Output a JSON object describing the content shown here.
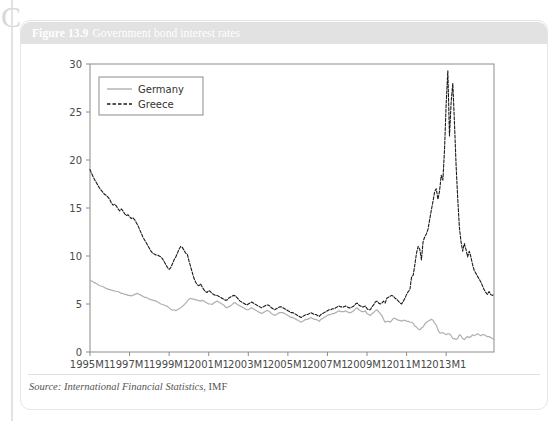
{
  "figure": {
    "number": "Figure 13.9",
    "title": "Government bond interest rates",
    "source_label": "Source:",
    "source_publication": "International Financial Statistics",
    "source_org": ", IMF",
    "decorative_mark": "C"
  },
  "chart_data": {
    "type": "line",
    "title": "Government bond interest rates",
    "xlabel": "",
    "ylabel": "",
    "ylim": [
      0,
      30
    ],
    "yticks": [
      0,
      5,
      10,
      15,
      20,
      25,
      30
    ],
    "ytick_labels": [
      "0",
      "5",
      "10",
      "15",
      "20",
      "25",
      "30"
    ],
    "xlim": [
      "1995M1",
      "2014M6"
    ],
    "xticks": [
      "1995M1",
      "1997M1",
      "1999M1",
      "2001M1",
      "2003M1",
      "2005M1",
      "2007M1",
      "2009M1",
      "2011M1",
      "2013M1"
    ],
    "xtick_labels": [
      "1995M1",
      "1997M1",
      "1999M1",
      "2001M1",
      "2003M1",
      "2005M1",
      "2007M1",
      "2009M1",
      "2011M1",
      "2013M1"
    ],
    "grid": false,
    "legend_position": "upper left",
    "series": [
      {
        "name": "Germany",
        "style": "solid",
        "color": "#b0b0b0",
        "values": [
          7.5,
          7.4,
          7.3,
          7.2,
          7.1,
          7.0,
          6.9,
          6.85,
          6.8,
          6.7,
          6.6,
          6.55,
          6.5,
          6.45,
          6.4,
          6.35,
          6.3,
          6.3,
          6.2,
          6.1,
          6.1,
          6.0,
          6.0,
          5.9,
          5.9,
          5.85,
          5.9,
          6.0,
          6.05,
          6.1,
          6.0,
          5.9,
          5.8,
          5.7,
          5.7,
          5.6,
          5.5,
          5.45,
          5.4,
          5.35,
          5.3,
          5.2,
          5.1,
          5.0,
          4.95,
          4.9,
          4.8,
          4.75,
          4.6,
          4.45,
          4.35,
          4.4,
          4.3,
          4.4,
          4.5,
          4.6,
          4.75,
          4.9,
          5.1,
          5.3,
          5.5,
          5.6,
          5.5,
          5.5,
          5.45,
          5.4,
          5.35,
          5.3,
          5.4,
          5.3,
          5.2,
          5.1,
          5.0,
          5.0,
          4.95,
          5.1,
          5.2,
          5.3,
          5.2,
          5.1,
          5.0,
          4.9,
          4.7,
          4.6,
          4.7,
          4.8,
          4.9,
          5.1,
          5.15,
          5.0,
          4.9,
          4.8,
          4.7,
          4.6,
          4.5,
          4.4,
          4.4,
          4.5,
          4.6,
          4.5,
          4.4,
          4.3,
          4.2,
          4.1,
          4.0,
          4.1,
          4.2,
          4.3,
          4.3,
          4.2,
          4.0,
          3.9,
          3.8,
          3.9,
          4.0,
          4.1,
          4.1,
          4.1,
          4.0,
          3.9,
          3.8,
          3.7,
          3.6,
          3.6,
          3.5,
          3.4,
          3.3,
          3.2,
          3.1,
          3.2,
          3.3,
          3.4,
          3.4,
          3.5,
          3.6,
          3.5,
          3.4,
          3.4,
          3.3,
          3.2,
          3.4,
          3.5,
          3.6,
          3.7,
          3.8,
          3.9,
          3.9,
          4.0,
          4.0,
          4.1,
          4.2,
          4.3,
          4.2,
          4.2,
          4.2,
          4.3,
          4.2,
          4.1,
          4.1,
          4.2,
          4.3,
          4.5,
          4.6,
          4.4,
          4.3,
          4.2,
          4.2,
          4.3,
          4.0,
          3.9,
          3.8,
          4.0,
          4.1,
          4.3,
          4.4,
          4.2,
          4.0,
          3.8,
          3.4,
          3.1,
          3.2,
          3.2,
          3.1,
          3.3,
          3.5,
          3.5,
          3.4,
          3.3,
          3.3,
          3.2,
          3.3,
          3.3,
          3.2,
          3.2,
          3.1,
          3.1,
          3.0,
          2.7,
          2.6,
          2.4,
          2.3,
          2.5,
          2.6,
          2.9,
          3.1,
          3.2,
          3.3,
          3.4,
          3.3,
          3.0,
          2.8,
          2.3,
          2.0,
          2.0,
          2.0,
          1.9,
          1.8,
          1.9,
          1.9,
          1.7,
          1.4,
          1.4,
          1.3,
          1.4,
          1.8,
          1.7,
          1.4,
          1.3,
          1.5,
          1.6,
          1.5,
          1.6,
          1.8,
          1.7,
          1.8,
          1.9,
          1.8,
          1.7,
          1.8,
          1.8,
          1.7,
          1.6,
          1.6,
          1.5,
          1.4,
          1.3
        ]
      },
      {
        "name": "Greece",
        "style": "dashed",
        "color": "#1a1a1a",
        "values": [
          19.0,
          18.6,
          18.2,
          17.9,
          17.6,
          17.3,
          17.0,
          16.8,
          16.6,
          16.4,
          16.3,
          16.1,
          15.9,
          15.5,
          15.3,
          15.4,
          15.2,
          14.9,
          14.7,
          14.9,
          14.7,
          14.4,
          14.2,
          14.3,
          14.1,
          13.9,
          14.0,
          13.8,
          13.5,
          13.2,
          12.8,
          12.4,
          12.0,
          11.7,
          11.4,
          11.1,
          10.8,
          10.5,
          10.3,
          10.2,
          10.1,
          10.1,
          10.0,
          9.9,
          9.7,
          9.4,
          9.1,
          8.8,
          8.6,
          8.8,
          9.2,
          9.6,
          9.9,
          10.3,
          10.7,
          11.0,
          10.9,
          10.6,
          10.3,
          10.2,
          9.5,
          8.9,
          8.3,
          7.7,
          7.3,
          7.0,
          6.9,
          7.1,
          6.8,
          6.5,
          6.3,
          6.2,
          6.4,
          6.3,
          6.1,
          6.0,
          5.9,
          5.9,
          5.8,
          5.7,
          5.6,
          5.5,
          5.4,
          5.4,
          5.6,
          5.7,
          5.8,
          5.9,
          5.85,
          5.7,
          5.5,
          5.3,
          5.2,
          5.1,
          5.0,
          4.9,
          5.0,
          5.1,
          5.2,
          5.1,
          5.0,
          4.9,
          4.8,
          4.7,
          4.6,
          4.7,
          4.8,
          4.9,
          4.9,
          4.8,
          4.6,
          4.5,
          4.4,
          4.5,
          4.6,
          4.7,
          4.7,
          4.6,
          4.5,
          4.4,
          4.3,
          4.2,
          4.1,
          4.1,
          4.0,
          3.9,
          3.8,
          3.7,
          3.6,
          3.7,
          3.8,
          3.9,
          3.9,
          4.0,
          4.1,
          4.0,
          3.9,
          3.9,
          3.8,
          3.7,
          3.9,
          4.0,
          4.1,
          4.2,
          4.3,
          4.4,
          4.4,
          4.5,
          4.5,
          4.6,
          4.7,
          4.8,
          4.7,
          4.7,
          4.7,
          4.8,
          4.7,
          4.6,
          4.6,
          4.7,
          4.8,
          5.0,
          5.1,
          4.9,
          4.8,
          4.7,
          4.7,
          4.8,
          4.5,
          4.4,
          4.4,
          4.7,
          4.9,
          5.2,
          5.3,
          5.1,
          5.0,
          5.1,
          5.3,
          5.1,
          5.6,
          5.7,
          5.8,
          5.9,
          5.8,
          5.6,
          5.5,
          5.3,
          5.1,
          5.0,
          5.3,
          5.6,
          6.0,
          6.3,
          6.5,
          7.8,
          8.0,
          9.1,
          10.3,
          11.0,
          10.7,
          9.6,
          11.5,
          12.0,
          12.3,
          12.8,
          13.8,
          14.8,
          15.7,
          16.7,
          17.0,
          15.9,
          16.8,
          18.4,
          17.9,
          21.1,
          25.9,
          29.3,
          22.5,
          26.0,
          28.0,
          24.0,
          19.5,
          16.0,
          13.0,
          11.5,
          10.5,
          11.3,
          10.7,
          9.9,
          10.5,
          9.9,
          9.1,
          8.5,
          8.2,
          7.9,
          7.6,
          7.3,
          6.9,
          6.5,
          6.2,
          6.0,
          6.3,
          6.0,
          5.9,
          6.0
        ]
      }
    ]
  },
  "legend": {
    "items": [
      {
        "label": "Germany",
        "style": "solid",
        "color": "#b0b0b0"
      },
      {
        "label": "Greece",
        "style": "dashed",
        "color": "#1a1a1a"
      }
    ]
  }
}
